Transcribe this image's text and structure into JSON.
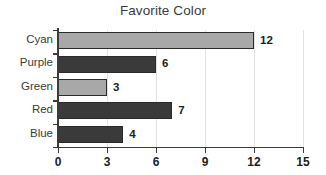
{
  "chart_data": {
    "type": "bar",
    "orientation": "horizontal",
    "title": "Favorite Color",
    "xlabel": "",
    "ylabel": "",
    "categories": [
      "Cyan",
      "Purple",
      "Green",
      "Red",
      "Blue"
    ],
    "values": [
      12,
      6,
      3,
      7,
      4
    ],
    "value_labels": [
      "12",
      "6",
      "3",
      "7",
      "4"
    ],
    "bar_colors": [
      "#a8a8a8",
      "#3a3a3a",
      "#a8a8a8",
      "#3a3a3a",
      "#3a3a3a"
    ],
    "bar_border_color": "#2b2b2b",
    "xlim": [
      0,
      15
    ],
    "xticks": [
      0,
      3,
      6,
      9,
      12,
      15
    ],
    "xtick_labels": [
      "0",
      "3",
      "6",
      "9",
      "12",
      "15"
    ],
    "grid": true,
    "grid_axis": "x",
    "grid_color": "#e2e2e2",
    "legend": false,
    "axis_color": "#3c3c3c",
    "background": "#ffffff"
  }
}
